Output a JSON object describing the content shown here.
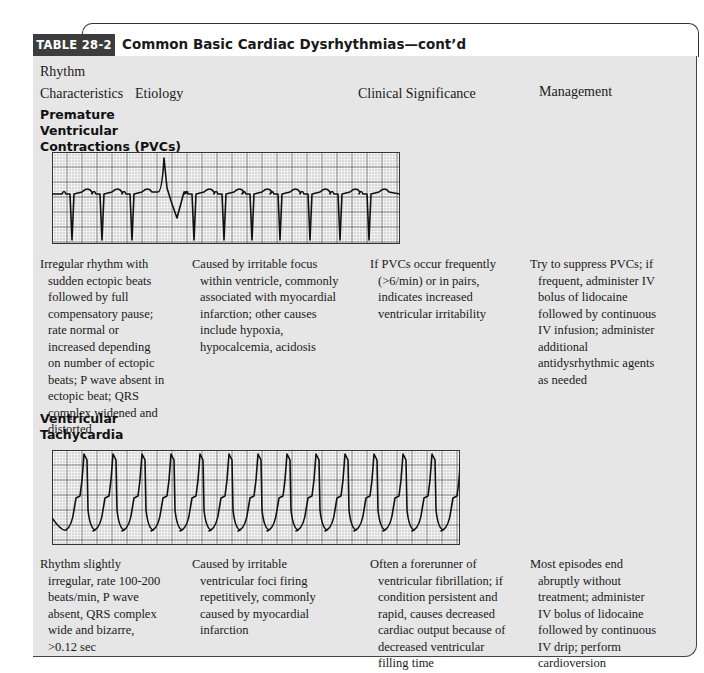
{
  "table": {
    "label": "TABLE 28-2",
    "title": "Common Basic Cardiac Dysrhythmias—cont’d"
  },
  "columns": {
    "rhythm_line1": "Rhythm",
    "rhythm_line2": "Characteristics",
    "etiology": "Etiology",
    "clinical": "Clinical Significance",
    "management": "Management"
  },
  "rows": [
    {
      "name_lines": [
        "Premature",
        "Ventricular",
        "Contractions (PVCs)"
      ],
      "ecg_icon": "pvc-ecg-strip",
      "characteristics": "Irregular rhythm with sudden ectopic beats followed by full compensatory pause; rate normal or increased depending on number of ectopic beats; P wave absent in ectopic beat; QRS complex widened and distorted",
      "etiology": "Caused by irritable focus within ventricle, commonly associated with myocardial infarction; other causes include hypoxia, hypocalcemia, acidosis",
      "clinical": "If PVCs occur frequently (>6/min) or in pairs, indicates increased ventricular irritability",
      "management": "Try to suppress PVCs; if frequent, administer IV bolus of lidocaine followed by continuous IV infusion; administer additional antidysrhythmic agents as needed"
    },
    {
      "name_lines": [
        "Ventricular",
        "Tachycardia"
      ],
      "ecg_icon": "vtach-ecg-strip",
      "characteristics": "Rhythm slightly irregular, rate 100-200 beats/min, P wave absent, QRS complex wide and bizarre, >0.12 sec",
      "etiology": "Caused by irritable ventricular foci firing repetitively, commonly caused by myocardial infarction",
      "clinical": "Often a forerunner of ventricular fibrillation; if condition persistent and rapid, causes decreased cardiac output because of decreased ventricular filling time",
      "management": "Most episodes end abruptly without treatment; administer IV bolus of lidocaine followed by continuous IV drip; perform cardioversion"
    }
  ]
}
